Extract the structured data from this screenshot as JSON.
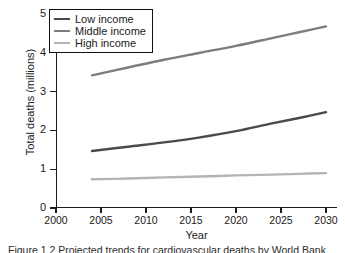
{
  "chart_data": {
    "type": "line",
    "title": "",
    "xlabel": "Year",
    "ylabel": "Total deaths (millions)",
    "xlim": [
      2000,
      2031
    ],
    "ylim": [
      0,
      5
    ],
    "xticks": [
      "2000",
      "2005",
      "2010",
      "2015",
      "2020",
      "2025",
      "2030"
    ],
    "yticks": [
      "0",
      "1",
      "2",
      "3",
      "4",
      "5"
    ],
    "grid": false,
    "legend_position": "upper left",
    "x": [
      2004,
      2008,
      2012,
      2016,
      2020,
      2024,
      2027,
      2030
    ],
    "series": [
      {
        "name": "Low income",
        "color": "#4a4a4a",
        "values": [
          1.47,
          1.58,
          1.69,
          1.82,
          1.98,
          2.18,
          2.32,
          2.47
        ]
      },
      {
        "name": "Middle income",
        "color": "#7d7d7d",
        "values": [
          3.42,
          3.62,
          3.82,
          4.0,
          4.18,
          4.38,
          4.53,
          4.68
        ]
      },
      {
        "name": "High income",
        "color": "#b4b4b4",
        "values": [
          0.74,
          0.76,
          0.79,
          0.81,
          0.84,
          0.86,
          0.88,
          0.9
        ]
      }
    ]
  },
  "legend": {
    "items": [
      {
        "label": "Low income",
        "color": "#4a4a4a"
      },
      {
        "label": "Middle income",
        "color": "#7d7d7d"
      },
      {
        "label": "High income",
        "color": "#b4b4b4"
      }
    ]
  },
  "caption": {
    "text": "Figure 1.2 Projected trends for cardiovascular deaths by World Bank"
  }
}
